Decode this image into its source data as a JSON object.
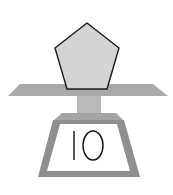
{
  "scale": {
    "object_shape": "pentagon",
    "reading_label": "10",
    "colors": {
      "pentagon_fill": "#d4d4d4",
      "pentagon_stroke": "#1a1a1a",
      "plate_fill": "#a9a9a9",
      "stem_fill": "#b9b9b9",
      "base_fill": "#8f8f8f",
      "base_cap_fill": "#a4a4a4",
      "display_fill": "#ffffff",
      "text_color": "#111111"
    }
  }
}
